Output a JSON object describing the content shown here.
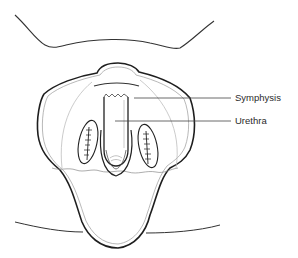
{
  "diagram": {
    "type": "anatomical-line-drawing",
    "labels": [
      {
        "id": "symphysis",
        "text": "Symphysis",
        "x": 235,
        "y": 93
      },
      {
        "id": "urethra",
        "text": "Urethra",
        "x": 235,
        "y": 116
      }
    ],
    "colors": {
      "ink": "#222222",
      "thin_ink": "#9a9a9a",
      "background": "#ffffff"
    }
  }
}
